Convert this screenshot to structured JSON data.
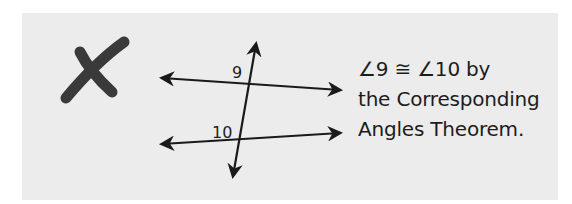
{
  "figure": {
    "mark": "✗",
    "mark_meaning": "incorrect",
    "diagram": {
      "lines": [
        "top-parallel-line",
        "bottom-parallel-line",
        "transversal"
      ],
      "angle_labels": [
        "9",
        "10"
      ]
    },
    "statement": {
      "line1": "∠9 ≅ ∠10 by",
      "line2": "the Corresponding",
      "line3": "Angles Theorem."
    }
  }
}
